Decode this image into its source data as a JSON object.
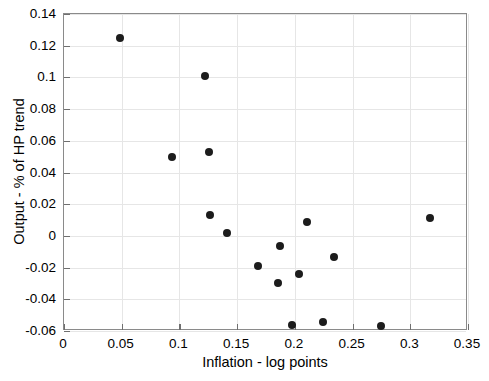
{
  "chart_data": {
    "type": "scatter",
    "title": "",
    "xlabel": "Inflation - log points",
    "ylabel": "Output - % of HP trend",
    "xlim": [
      0,
      0.35
    ],
    "ylim": [
      -0.06,
      0.14
    ],
    "xticks": [
      0,
      0.05,
      0.1,
      0.15,
      0.2,
      0.25,
      0.3,
      0.35
    ],
    "xtick_labels": [
      "0",
      "0.05",
      "0.1",
      "0.15",
      "0.2",
      "0.25",
      "0.3",
      "0.35"
    ],
    "yticks": [
      -0.06,
      -0.04,
      -0.02,
      0,
      0.02,
      0.04,
      0.06,
      0.08,
      0.1,
      0.12,
      0.14
    ],
    "ytick_labels": [
      "-0.06",
      "-0.04",
      "-0.02",
      "0",
      "0.02",
      "0.04",
      "0.06",
      "0.08",
      "0.1",
      "0.12",
      "0.14"
    ],
    "grid": true,
    "legend": "none",
    "marker": {
      "shape": "circle",
      "color": "#1c1c1c",
      "size_px": 8
    },
    "points": [
      {
        "x": 0.0485,
        "y": 0.125
      },
      {
        "x": 0.0935,
        "y": 0.0495
      },
      {
        "x": 0.122,
        "y": 0.101
      },
      {
        "x": 0.1255,
        "y": 0.053
      },
      {
        "x": 0.1265,
        "y": 0.013
      },
      {
        "x": 0.1415,
        "y": 0.002
      },
      {
        "x": 0.168,
        "y": -0.019
      },
      {
        "x": 0.1855,
        "y": -0.03
      },
      {
        "x": 0.1875,
        "y": -0.0065
      },
      {
        "x": 0.1975,
        "y": -0.056
      },
      {
        "x": 0.2035,
        "y": -0.024
      },
      {
        "x": 0.2105,
        "y": 0.009
      },
      {
        "x": 0.224,
        "y": -0.0545
      },
      {
        "x": 0.2335,
        "y": -0.013
      },
      {
        "x": 0.2745,
        "y": -0.057
      },
      {
        "x": 0.317,
        "y": 0.011
      }
    ]
  },
  "colors": {
    "marker": "#1c1c1c",
    "grid": "#e6e6e6",
    "axis": "#8a8a8a",
    "background": "#ffffff",
    "text": "#000000"
  }
}
